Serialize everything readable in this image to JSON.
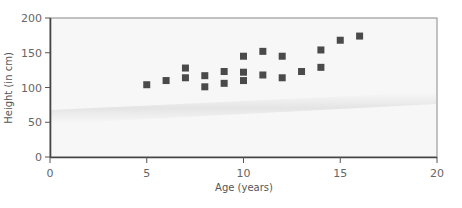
{
  "chart_data": {
    "type": "scatter",
    "title": "",
    "xlabel": "Age (years)",
    "ylabel": "Height (in cm)",
    "xlim": [
      0,
      20
    ],
    "ylim": [
      0,
      200
    ],
    "xticks": [
      0,
      5,
      10,
      15,
      20
    ],
    "yticks": [
      0,
      50,
      100,
      150,
      200
    ],
    "grid": false,
    "legend": null,
    "marker": "square",
    "marker_color": "#4a4a4a",
    "plot_background": "#f7f7f7",
    "points": [
      {
        "x": 5,
        "y": 104
      },
      {
        "x": 6,
        "y": 110
      },
      {
        "x": 7,
        "y": 128
      },
      {
        "x": 7,
        "y": 114
      },
      {
        "x": 8,
        "y": 117
      },
      {
        "x": 8,
        "y": 101
      },
      {
        "x": 9,
        "y": 123
      },
      {
        "x": 9,
        "y": 106
      },
      {
        "x": 10,
        "y": 145
      },
      {
        "x": 10,
        "y": 122
      },
      {
        "x": 10,
        "y": 110
      },
      {
        "x": 11,
        "y": 152
      },
      {
        "x": 11,
        "y": 118
      },
      {
        "x": 12,
        "y": 145
      },
      {
        "x": 12,
        "y": 114
      },
      {
        "x": 13,
        "y": 123
      },
      {
        "x": 14,
        "y": 154
      },
      {
        "x": 14,
        "y": 129
      },
      {
        "x": 15,
        "y": 168
      },
      {
        "x": 16,
        "y": 174
      }
    ]
  }
}
